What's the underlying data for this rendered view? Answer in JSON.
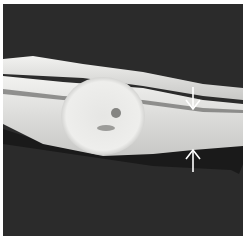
{
  "figure": {
    "type": "grayscale gross specimen photograph",
    "background_color": "#ffffff",
    "photo_background_color": "#2b2b2b",
    "tissue_color": "#e8e8e6",
    "annotations": [
      {
        "id": "arrow-down",
        "direction": "down",
        "x": 193,
        "y": 95
      },
      {
        "id": "arrow-up",
        "direction": "up",
        "x": 193,
        "y": 163
      }
    ]
  }
}
